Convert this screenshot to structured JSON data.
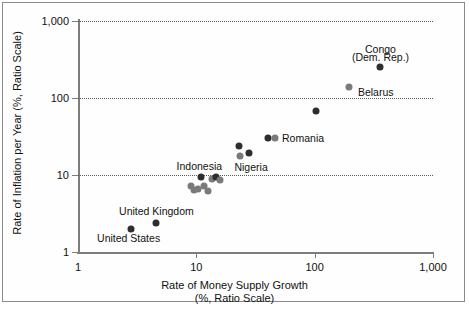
{
  "chart_data": {
    "type": "scatter",
    "title": "",
    "xlabel": "Rate of Money Supply Growth",
    "xlabel_sub": "(%, Ratio Scale)",
    "ylabel": "Rate of Inflation per Year (%, Ratio Scale)",
    "xscale": "log",
    "yscale": "log",
    "xlim": [
      1,
      1000
    ],
    "ylim": [
      1,
      1000
    ],
    "xticks": [
      "1",
      "10",
      "100",
      "1,000"
    ],
    "xtick_values": [
      1,
      10,
      100,
      1000
    ],
    "yticks": [
      "1",
      "10",
      "100",
      "1,000"
    ],
    "ytick_values": [
      1,
      10,
      100,
      1000
    ],
    "grid": "horizontal-dotted",
    "legend": "none",
    "colors": {
      "marker_dark": "#2e2e2e",
      "marker_gray": "#7a7a7a",
      "axis": "#7d7d7d",
      "gridline": "#5a5a5a",
      "frame": "#8a8a8a",
      "background": "#ffffff"
    },
    "points": [
      {
        "label": "United States",
        "x": 2.8,
        "y": 2.0,
        "shade": "dark"
      },
      {
        "label": "United Kingdom",
        "x": 4.6,
        "y": 2.4,
        "shade": "dark"
      },
      {
        "label": "",
        "x": 9.0,
        "y": 7.2,
        "shade": "gray"
      },
      {
        "label": "",
        "x": 9.6,
        "y": 6.3,
        "shade": "gray"
      },
      {
        "label": "",
        "x": 10.4,
        "y": 6.5,
        "shade": "gray"
      },
      {
        "label": "Indonesia",
        "x": 11.0,
        "y": 9.3,
        "shade": "dark"
      },
      {
        "label": "",
        "x": 11.6,
        "y": 7.3,
        "shade": "gray"
      },
      {
        "label": "",
        "x": 12.6,
        "y": 6.2,
        "shade": "gray"
      },
      {
        "label": "",
        "x": 13.6,
        "y": 9.0,
        "shade": "gray"
      },
      {
        "label": "",
        "x": 14.8,
        "y": 9.3,
        "shade": "dark"
      },
      {
        "label": "",
        "x": 16.0,
        "y": 8.6,
        "shade": "gray"
      },
      {
        "label": "Nigeria",
        "x": 23.0,
        "y": 24.0,
        "shade": "dark"
      },
      {
        "label": "",
        "x": 23.5,
        "y": 17.5,
        "shade": "gray"
      },
      {
        "label": "",
        "x": 28.0,
        "y": 19.5,
        "shade": "dark"
      },
      {
        "label": "Romania",
        "x": 40.0,
        "y": 30.0,
        "shade": "dark"
      },
      {
        "label": "",
        "x": 46.0,
        "y": 30.0,
        "shade": "gray"
      },
      {
        "label": "",
        "x": 103.0,
        "y": 68.0,
        "shade": "dark"
      },
      {
        "label": "Belarus",
        "x": 196.0,
        "y": 140.0,
        "shade": "gray"
      },
      {
        "label": "Congo (Dem. Rep.)",
        "x": 360.0,
        "y": 250.0,
        "shade": "dark"
      }
    ],
    "annotations": [
      {
        "text": "Congo",
        "x": 360.0,
        "y": 430.0,
        "align": "center"
      },
      {
        "text": "(Dem. Rep.)",
        "x": 360.0,
        "y": 340.0,
        "align": "center"
      },
      {
        "text": "Belarus",
        "x": 232.0,
        "y": 118.0,
        "align": "left"
      },
      {
        "text": "Romania",
        "x": 53.0,
        "y": 30.0,
        "align": "left"
      },
      {
        "text": "Nigeria",
        "x": 21.0,
        "y": 12.6,
        "align": "left"
      },
      {
        "text": "Indonesia",
        "x": 10.6,
        "y": 13.0,
        "align": "center"
      },
      {
        "text": "United Kingdom",
        "x": 4.6,
        "y": 3.4,
        "align": "center"
      },
      {
        "text": "United States",
        "x": 1.45,
        "y": 1.52,
        "align": "left"
      }
    ]
  }
}
